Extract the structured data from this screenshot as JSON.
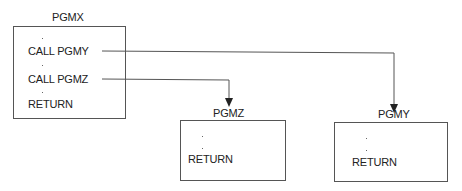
{
  "diagram": {
    "caller": {
      "title": "PGMX",
      "lines": [
        "CALL PGMY",
        "CALL PGMZ",
        "RETURN"
      ]
    },
    "callees": [
      {
        "title": "PGMZ",
        "lines": [
          "RETURN"
        ]
      },
      {
        "title": "PGMY",
        "lines": [
          "RETURN"
        ]
      }
    ],
    "edges": [
      {
        "from": "CALL PGMY",
        "to": "PGMY"
      },
      {
        "from": "CALL PGMZ",
        "to": "PGMZ"
      }
    ],
    "colors": {
      "line": "#555555",
      "text": "#222222"
    }
  }
}
